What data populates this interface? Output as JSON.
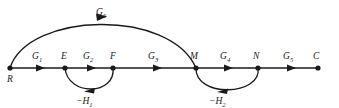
{
  "figure": {
    "type": "signal-flow-graph",
    "background_color": "#ffffff",
    "line_color": "#1a1a1a",
    "width": 339,
    "height": 108
  },
  "nodes": [
    {
      "id": "R",
      "label": "R",
      "x": 10,
      "y": 68,
      "label_x": 7,
      "label_y": 82
    },
    {
      "id": "E",
      "label": "E",
      "x": 65,
      "y": 68,
      "label_x": 61,
      "label_y": 59
    },
    {
      "id": "F",
      "label": "F",
      "x": 113,
      "y": 68,
      "label_x": 110,
      "label_y": 59
    },
    {
      "id": "M",
      "label": "M",
      "x": 196,
      "y": 68,
      "label_x": 191,
      "label_y": 59
    },
    {
      "id": "N",
      "label": "N",
      "x": 258,
      "y": 68,
      "label_x": 254,
      "label_y": 59
    },
    {
      "id": "C",
      "label": "C",
      "x": 318,
      "y": 68,
      "label_x": 314,
      "label_y": 59
    }
  ],
  "forward_edges": [
    {
      "name": "G1",
      "from": "R",
      "to": "E",
      "base": "G",
      "sub": "1",
      "label_x": 33,
      "label_y": 59,
      "arrow_x": 40,
      "arrow_y": 68
    },
    {
      "name": "G2",
      "from": "E",
      "to": "F",
      "base": "G",
      "sub": "2",
      "label_x": 84,
      "label_y": 59,
      "arrow_x": 91,
      "arrow_y": 68
    },
    {
      "name": "G3",
      "from": "F",
      "to": "M",
      "base": "G",
      "sub": "3",
      "label_x": 149,
      "label_y": 59,
      "arrow_x": 157,
      "arrow_y": 68
    },
    {
      "name": "G4",
      "from": "M",
      "to": "N",
      "base": "G",
      "sub": "4",
      "label_x": 221,
      "label_y": 59,
      "arrow_x": 228,
      "arrow_y": 68
    },
    {
      "name": "G5",
      "from": "N",
      "to": "C",
      "base": "G",
      "sub": "5",
      "label_x": 284,
      "label_y": 59,
      "arrow_x": 291,
      "arrow_y": 68
    }
  ],
  "feedforward_arc": {
    "name": "G6",
    "from": "R",
    "to": "M",
    "base": "G",
    "sub": "6",
    "label_x": 98,
    "label_y": 15,
    "direction": "left-to-right"
  },
  "feedback_arcs": [
    {
      "name": "-H1",
      "from": "F",
      "to": "E",
      "base": "−H",
      "sub": "1",
      "label_x": 79,
      "label_y": 104,
      "direction": "right-to-left"
    },
    {
      "name": "-H2",
      "from": "N",
      "to": "M",
      "base": "−H",
      "sub": "2",
      "label_x": 212,
      "label_y": 104,
      "direction": "right-to-left"
    }
  ]
}
